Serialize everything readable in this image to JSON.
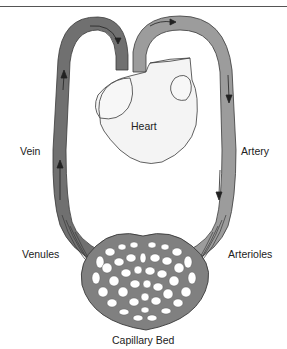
{
  "diagram": {
    "type": "anatomical-diagram",
    "colors": {
      "vein": "#707070",
      "artery": "#9c9c9c",
      "outline": "#3a3a3a",
      "heart_fill": "#f4f4f4",
      "background": "#ffffff"
    },
    "labels": {
      "heart": "Heart",
      "vein": "Vein",
      "artery": "Artery",
      "venules": "Venules",
      "arterioles": "Arterioles",
      "capillary_bed": "Capillary Bed"
    },
    "flow": [
      "Heart",
      "Artery",
      "Arterioles",
      "Capillary Bed",
      "Venules",
      "Vein",
      "Heart"
    ]
  }
}
